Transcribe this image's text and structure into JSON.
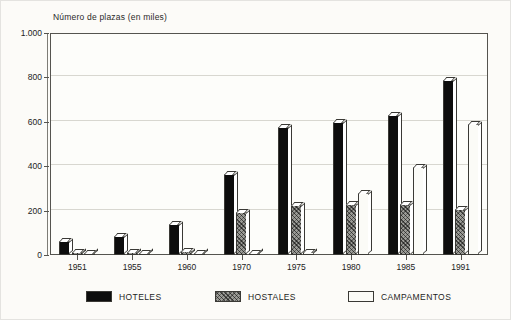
{
  "chart_data": {
    "type": "bar",
    "title": "Número de plazas (en miles)",
    "xlabel": "",
    "ylabel": "Número de plazas (en miles)",
    "ylim": [
      0,
      1000
    ],
    "ytick_labels": [
      "0",
      "200",
      "400",
      "600",
      "800",
      "1.000"
    ],
    "ytick_values": [
      0,
      200,
      400,
      600,
      800,
      1000
    ],
    "grid": true,
    "legend_position": "bottom",
    "categories": [
      "1951",
      "1955",
      "1960",
      "1970",
      "1975",
      "1980",
      "1985",
      "1991"
    ],
    "series": [
      {
        "name": "HOTELES",
        "color": "#0d0d0d",
        "values": [
          65,
          85,
          140,
          365,
          575,
          600,
          630,
          790
        ]
      },
      {
        "name": "HOSTALES",
        "color": "#9b9b96",
        "values": [
          12,
          14,
          20,
          195,
          225,
          228,
          232,
          208
        ]
      },
      {
        "name": "CAMPAMENTOS",
        "color": "#fbfbf7",
        "values": [
          4,
          5,
          8,
          10,
          12,
          278,
          398,
          592
        ]
      }
    ]
  },
  "legend": {
    "items": [
      {
        "label": "HOTELES",
        "swatch": "hoteles"
      },
      {
        "label": "HOSTALES",
        "swatch": "hostales"
      },
      {
        "label": "CAMPAMENTOS",
        "swatch": "campamentos"
      }
    ]
  }
}
